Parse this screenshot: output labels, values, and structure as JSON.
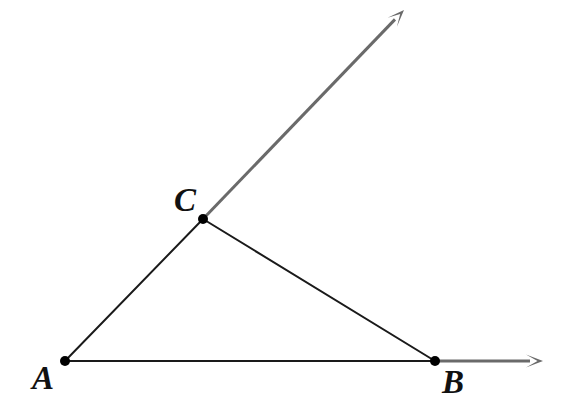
{
  "figure": {
    "background_color": "#ffffff",
    "width": 575,
    "height": 410,
    "points": [
      {
        "id": "A",
        "label": "A",
        "x": 65,
        "y": 361,
        "dot_radius": 5
      },
      {
        "id": "B",
        "label": "B",
        "x": 435,
        "y": 361,
        "dot_radius": 5
      },
      {
        "id": "C",
        "label": "C",
        "x": 203,
        "y": 219,
        "dot_radius": 5
      }
    ],
    "segments": [
      {
        "id": "segment-AC",
        "from": "A",
        "to": "C",
        "x1": 65,
        "y1": 361,
        "x2": 203,
        "y2": 219,
        "color": "#1a1a1a",
        "width": 2
      },
      {
        "id": "segment-CB",
        "from": "C",
        "to": "B",
        "x1": 203,
        "y1": 219,
        "x2": 435,
        "y2": 361,
        "color": "#1a1a1a",
        "width": 2
      },
      {
        "id": "segment-AB",
        "from": "A",
        "to": "B",
        "x1": 65,
        "y1": 361,
        "x2": 435,
        "y2": 361,
        "color": "#1a1a1a",
        "width": 2
      }
    ],
    "rays": [
      {
        "id": "ray-from-C",
        "origin": "C",
        "x1": 203,
        "y1": 219,
        "x2": 404,
        "y2": 10,
        "color": "#6a6a6a",
        "width": 3,
        "arrowhead": "open-arrow",
        "tip_x": 404,
        "tip_y": 10
      },
      {
        "id": "ray-from-B",
        "origin": "B",
        "x1": 435,
        "y1": 361,
        "x2": 543,
        "y2": 361,
        "color": "#6a6a6a",
        "width": 3,
        "arrowhead": "open-arrow",
        "tip_x": 543,
        "tip_y": 361
      }
    ],
    "dot_color": "#000000",
    "label_color": "#111111"
  }
}
